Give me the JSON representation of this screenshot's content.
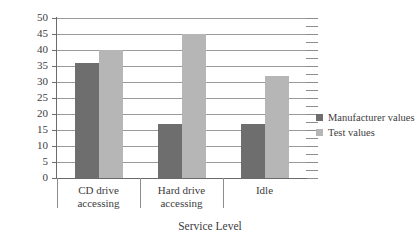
{
  "chart_data": {
    "type": "bar",
    "title": "",
    "xlabel": "Service Level",
    "ylabel": "",
    "ylim": [
      0,
      50
    ],
    "ytick_step": 5,
    "yticks": [
      50,
      45,
      40,
      35,
      30,
      25,
      20,
      15,
      10,
      5,
      0
    ],
    "grid": true,
    "legend_position": "right",
    "categories": [
      "CD drive accessing",
      "Hard drive accessing",
      "Idle"
    ],
    "category_lines": [
      [
        "CD drive",
        "accessing"
      ],
      [
        "Hard drive",
        "accessing"
      ],
      [
        "Idle",
        ""
      ]
    ],
    "series": [
      {
        "name": "Manufacturer values",
        "color": "#6e6e6e",
        "values": [
          36,
          17,
          17
        ]
      },
      {
        "name": "Test values",
        "color": "#b6b6b6",
        "values": [
          40,
          45,
          32
        ]
      }
    ]
  },
  "legend": {
    "items": [
      {
        "label": "Manufacturer values",
        "swatch": "manufacturer"
      },
      {
        "label": "Test values",
        "swatch": "test"
      }
    ]
  },
  "axis": {
    "x_title": "Service Level"
  }
}
